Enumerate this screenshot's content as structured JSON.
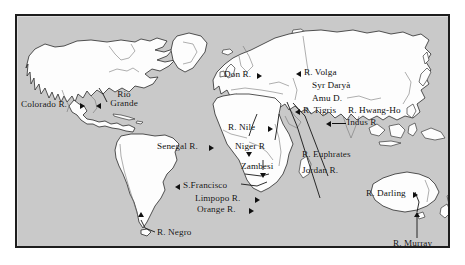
{
  "map": {
    "title": "World map of major rivers",
    "background_color": "#c9c9c9",
    "land_color": "#fdfdfd",
    "outline_color": "#2a2a2a",
    "frame_color": "#1d1d1d",
    "label_color": "#101010",
    "projection_note": "equirectangular world map, continents as filled outlines"
  },
  "labels": [
    {
      "id": "colorado",
      "text": "Colorado R.",
      "arrow": "right",
      "continent": "North America"
    },
    {
      "id": "rio-grande",
      "text": "Rio Grande",
      "arrow": "left",
      "continent": "North America"
    },
    {
      "id": "don",
      "text": "Don R.",
      "arrow": "right",
      "continent": "Europe"
    },
    {
      "id": "volga",
      "text": "R. Volga",
      "arrow": "left",
      "continent": "Europe"
    },
    {
      "id": "syr-darya",
      "text": "Syr Daryà",
      "arrow": "none",
      "continent": "Asia"
    },
    {
      "id": "amu-darya",
      "text": "Amu D.",
      "arrow": "none",
      "continent": "Asia"
    },
    {
      "id": "tigris",
      "text": "R. Tigris",
      "arrow": "left",
      "continent": "Asia"
    },
    {
      "id": "hwang-ho",
      "text": "R. Hwang-Ho",
      "arrow": "none",
      "continent": "Asia"
    },
    {
      "id": "indus",
      "text": "Indus R",
      "arrow": "left",
      "continent": "Asia"
    },
    {
      "id": "nile",
      "text": "R. Nile",
      "arrow": "right",
      "continent": "Africa"
    },
    {
      "id": "senegal",
      "text": "Senegal R.",
      "arrow": "right",
      "continent": "Africa"
    },
    {
      "id": "niger",
      "text": "Niger R",
      "arrow": "down",
      "continent": "Africa"
    },
    {
      "id": "euphrates",
      "text": "R. Euphrates",
      "arrow": "leader",
      "continent": "Asia"
    },
    {
      "id": "jordan",
      "text": "Jordan R.",
      "arrow": "leader",
      "continent": "Asia"
    },
    {
      "id": "zambesi",
      "text": "Zambesi",
      "arrow": "down",
      "continent": "Africa"
    },
    {
      "id": "sao-francisco",
      "text": "S.Francisco",
      "arrow": "left",
      "continent": "South America"
    },
    {
      "id": "limpopo",
      "text": "Limpopo R.",
      "arrow": "right",
      "continent": "Africa"
    },
    {
      "id": "orange",
      "text": "Orange R.",
      "arrow": "right",
      "continent": "Africa"
    },
    {
      "id": "negro",
      "text": "R. Negro",
      "arrow": "leader",
      "continent": "South America"
    },
    {
      "id": "darling",
      "text": "R. Darling",
      "arrow": "right",
      "continent": "Australia"
    },
    {
      "id": "murray",
      "text": "R. Murray",
      "arrow": "leader",
      "continent": "Australia"
    }
  ]
}
